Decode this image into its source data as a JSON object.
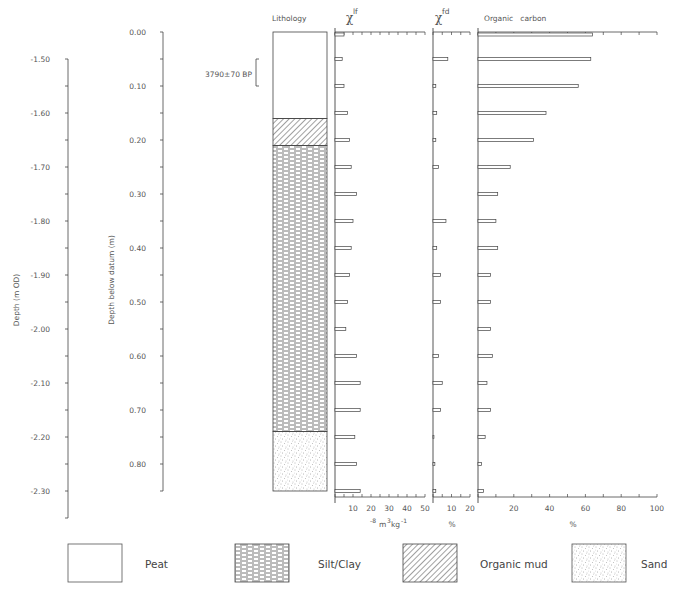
{
  "chart_data": {
    "type": "bar",
    "orientation": "horizontal",
    "title": "",
    "depth_axis_datum": {
      "label": "Depth below datum (m)",
      "ticks": [
        "0.00",
        "0.10",
        "0.20",
        "0.30",
        "0.40",
        "0.50",
        "0.60",
        "0.70",
        "0.80"
      ],
      "range": [
        0.0,
        0.85
      ]
    },
    "depth_axis_od": {
      "label": "Depth (m OD)",
      "ticks": [
        "-1.50",
        "-1.60",
        "-1.70",
        "-1.80",
        "-1.90",
        "-2.00",
        "-2.10",
        "-2.20",
        "-2.30"
      ],
      "range": [
        -1.42,
        -2.35
      ]
    },
    "lithology": {
      "title": "Lithology",
      "units": [
        {
          "name": "Peat",
          "top": 0.0,
          "base": 0.16
        },
        {
          "name": "Organic mud",
          "top": 0.16,
          "base": 0.21
        },
        {
          "name": "Silt/Clay",
          "top": 0.21,
          "base": 0.74
        },
        {
          "name": "Sand",
          "top": 0.74,
          "base": 0.85
        }
      ],
      "date_annotation": {
        "label": "3790±70 BP",
        "top": 0.05,
        "base": 0.1
      }
    },
    "depths": [
      0.0,
      0.05,
      0.1,
      0.15,
      0.2,
      0.25,
      0.3,
      0.35,
      0.4,
      0.45,
      0.5,
      0.55,
      0.6,
      0.65,
      0.7,
      0.75,
      0.8,
      0.85
    ],
    "series": [
      {
        "name": "χlf",
        "title_main": "χ",
        "title_sup": "lf",
        "xlabel": "10⁻⁸m³kg⁻¹",
        "xlim": [
          0,
          50
        ],
        "ticks": [
          "10",
          "20",
          "30",
          "40",
          "50"
        ],
        "values": [
          5,
          4,
          5,
          7,
          8,
          9,
          12,
          10,
          9,
          8,
          7,
          6,
          12,
          14,
          14,
          11,
          12,
          14
        ]
      },
      {
        "name": "χfd",
        "title_main": "χ",
        "title_sup": "fd",
        "xlabel": "%",
        "xlim": [
          0,
          20
        ],
        "ticks": [
          "10",
          "20"
        ],
        "values": [
          0,
          8,
          1.5,
          2,
          1.5,
          3,
          0,
          7,
          2,
          4,
          4,
          0,
          3,
          5,
          4,
          0.5,
          1,
          1.5
        ]
      },
      {
        "name": "Organic carbon",
        "title_main": "Organic   carbon",
        "title_sup": "",
        "xlabel": "%",
        "xlim": [
          0,
          100
        ],
        "ticks": [
          "20",
          "40",
          "60",
          "80",
          "100"
        ],
        "values": [
          64,
          63,
          56,
          38,
          31,
          18,
          11,
          10,
          11,
          7,
          7,
          7,
          8,
          5,
          7,
          4,
          2,
          3
        ]
      }
    ],
    "grid": false,
    "legend_position": "bottom"
  },
  "labels": {
    "lithology_title": "Lithology",
    "date": "3790±70 BP",
    "datum_axis_label": "Depth below datum (m)",
    "od_axis_label": "Depth (m OD)",
    "chi_lf_main": "χ",
    "chi_lf_sup": "lf",
    "chi_fd_main": "χ",
    "chi_fd_sup": "fd",
    "oc_title": "Organic   carbon",
    "chi_lf_unit_pre": "10",
    "chi_lf_unit": "-8",
    "chi_lf_unit_rest": "m",
    "chi_lf_unit_sup2": "3",
    "chi_lf_unit_kg": "kg",
    "chi_lf_unit_sup3": "-1",
    "chi_fd_unit": "%",
    "oc_unit": "%"
  },
  "legend": [
    {
      "label": "Peat",
      "pattern": "blank"
    },
    {
      "label": "Silt/Clay",
      "pattern": "dashes"
    },
    {
      "label": "Organic mud",
      "pattern": "hatch"
    },
    {
      "label": "Sand",
      "pattern": "stipple"
    }
  ],
  "colors": {
    "line": "#444444",
    "bar_fill": "#ffffff",
    "text": "#555555"
  }
}
